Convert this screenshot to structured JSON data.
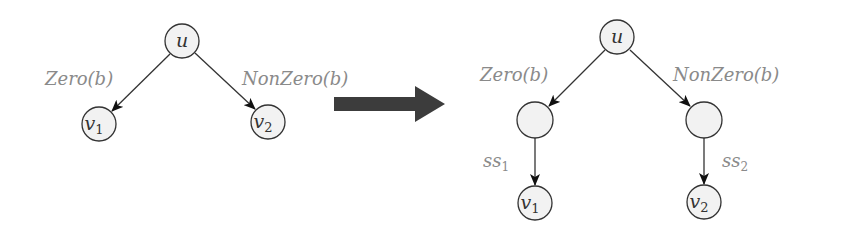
{
  "colors": {
    "node_fill": "#f2f2f2",
    "stroke": "#333333",
    "label": "#8a8a8a",
    "transform_arrow": "#3c3c3c"
  },
  "left_graph": {
    "nodes": {
      "root": "u",
      "left_leaf": "v",
      "left_leaf_sub": "1",
      "right_leaf": "v",
      "right_leaf_sub": "2"
    },
    "edges": {
      "left": "Zero(b)",
      "right": "NonZero(b)"
    }
  },
  "transform_arrow": {
    "icon": "right-arrow-icon"
  },
  "right_graph": {
    "nodes": {
      "root": "u",
      "left_mid": "",
      "right_mid": "",
      "left_leaf": "v",
      "left_leaf_sub": "1",
      "right_leaf": "v",
      "right_leaf_sub": "2"
    },
    "edges": {
      "left": "Zero(b)",
      "right": "NonZero(b)",
      "left_down": "ss",
      "left_down_sub": "1",
      "right_down": "ss",
      "right_down_sub": "2"
    }
  }
}
